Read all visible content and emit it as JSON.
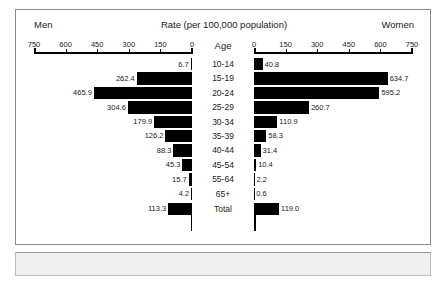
{
  "header": {
    "left_label": "Men",
    "title": "Rate (per 100,000 population)",
    "right_label": "Women",
    "age_heading": "Age"
  },
  "chart_data": {
    "type": "bar",
    "title": "Rate (per 100,000 population)",
    "subtitle": "",
    "xlabel": "Rate (per 100,000 population)",
    "ylabel": "Age",
    "orientation": "horizontal-diverging",
    "layout": "population-pyramid",
    "grid": false,
    "legend_position": "none",
    "xlim": [
      0,
      750
    ],
    "left_axis": {
      "name": "Men",
      "ticks": [
        750,
        600,
        450,
        300,
        150,
        0
      ],
      "tick_labels": [
        "750",
        "600",
        "450",
        "300",
        "150",
        "0"
      ],
      "direction": "right-to-left"
    },
    "right_axis": {
      "name": "Women",
      "ticks": [
        0,
        150,
        300,
        450,
        600,
        750
      ],
      "tick_labels": [
        "0",
        "150",
        "300",
        "450",
        "600",
        "750"
      ],
      "direction": "left-to-right"
    },
    "categories": [
      "10-14",
      "15-19",
      "20-24",
      "25-29",
      "30-34",
      "35-39",
      "40-44",
      "45-54",
      "55-64",
      "65+",
      "Total"
    ],
    "series": [
      {
        "name": "Men",
        "side": "left",
        "values": [
          6.7,
          262.4,
          465.9,
          304.6,
          179.9,
          126.2,
          88.3,
          45.3,
          15.7,
          4.2,
          113.3
        ]
      },
      {
        "name": "Women",
        "side": "right",
        "values": [
          40.8,
          634.7,
          595.2,
          260.7,
          110.9,
          58.3,
          31.4,
          10.4,
          2.2,
          0.6,
          119.0
        ]
      }
    ],
    "rows": [
      {
        "age": "10-14",
        "men": 6.7,
        "men_label": "6.7",
        "women": 40.8,
        "women_label": "40.8"
      },
      {
        "age": "15-19",
        "men": 262.4,
        "men_label": "262.4",
        "women": 634.7,
        "women_label": "634.7"
      },
      {
        "age": "20-24",
        "men": 465.9,
        "men_label": "465.9",
        "women": 595.2,
        "women_label": "595.2"
      },
      {
        "age": "25-29",
        "men": 304.6,
        "men_label": "304.6",
        "women": 260.7,
        "women_label": "260.7"
      },
      {
        "age": "30-34",
        "men": 179.9,
        "men_label": "179.9",
        "women": 110.9,
        "women_label": "110.9"
      },
      {
        "age": "35-39",
        "men": 126.2,
        "men_label": "126.2",
        "women": 58.3,
        "women_label": "58.3"
      },
      {
        "age": "40-44",
        "men": 88.3,
        "men_label": "88.3",
        "women": 31.4,
        "women_label": "31.4"
      },
      {
        "age": "45-54",
        "men": 45.3,
        "men_label": "45.3",
        "women": 10.4,
        "women_label": "10.4"
      },
      {
        "age": "55-64",
        "men": 15.7,
        "men_label": "15.7",
        "women": 2.2,
        "women_label": "2.2"
      },
      {
        "age": "65+",
        "men": 4.2,
        "men_label": "4.2",
        "women": 0.6,
        "women_label": "0.6"
      },
      {
        "age": "Total",
        "men": 113.3,
        "men_label": "113.3",
        "women": 119.0,
        "women_label": "119.0"
      }
    ],
    "bar_color": "#000000"
  },
  "colors": {
    "bar": "#000000",
    "frame": "#8a8a8a",
    "text": "#1a1a1a",
    "footer": "#f0f0f0"
  }
}
